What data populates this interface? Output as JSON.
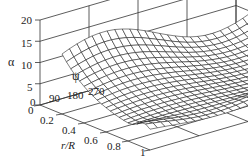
{
  "chart_data": {
    "type": "surface3d",
    "title": "",
    "zlabel": "α",
    "ylabel": "ψ",
    "xlabel": "r/R",
    "z_ticks": [
      "0",
      "5",
      "10",
      "15",
      "20"
    ],
    "zlim": [
      0,
      20
    ],
    "psi_ticks": [
      "0",
      "90",
      "180",
      "270"
    ],
    "psi_range": [
      0,
      360
    ],
    "r_ticks": [
      "0",
      "0.2",
      "0.4",
      "0.6",
      "0.8",
      "1"
    ],
    "r_range": [
      0,
      1
    ],
    "grid": true,
    "surface_samples": {
      "r": [
        0.2,
        0.4,
        0.6,
        0.8,
        1.0
      ],
      "psi": [
        0,
        90,
        180,
        270,
        360
      ],
      "alpha": [
        [
          10,
          16,
          15,
          12,
          10
        ],
        [
          7,
          10,
          9,
          8,
          7
        ],
        [
          5,
          7,
          6,
          6,
          5
        ],
        [
          4,
          5,
          5,
          5,
          4
        ],
        [
          3,
          3,
          3,
          4,
          3
        ]
      ]
    }
  },
  "labels": {
    "alpha": "α",
    "psi": "ψ",
    "r": "r/R",
    "z": [
      "20",
      "15",
      "10",
      "5",
      "0"
    ],
    "psi_ticks": [
      "90",
      "180",
      "270"
    ],
    "r_ticks": [
      "0",
      "0.2",
      "0.4",
      "0.6",
      "0.8",
      "1"
    ]
  },
  "colors": {
    "line": "#2a2a2a",
    "surface": "#1a1a1a",
    "background": "#ffffff"
  }
}
